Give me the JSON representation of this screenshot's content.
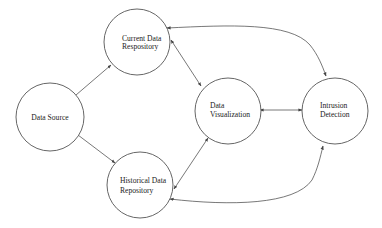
{
  "diagram": {
    "type": "flow",
    "nodes": [
      {
        "id": "data_source",
        "label_lines": [
          "Data Source"
        ],
        "cx": 50,
        "cy": 117,
        "r": 34
      },
      {
        "id": "current_repo",
        "label_lines": [
          "Current Data",
          "Respository"
        ],
        "cx": 137,
        "cy": 42,
        "r": 33
      },
      {
        "id": "historical_repo",
        "label_lines": [
          "Historical Data",
          "Repository"
        ],
        "cx": 140,
        "cy": 185,
        "r": 33
      },
      {
        "id": "visualization",
        "label_lines": [
          "Data",
          "Visualization"
        ],
        "cx": 228,
        "cy": 111,
        "r": 33
      },
      {
        "id": "intrusion_detection",
        "label_lines": [
          "Intrusion",
          "Detection"
        ],
        "cx": 335,
        "cy": 111,
        "r": 33
      }
    ],
    "edges": [
      {
        "from": "data_source",
        "to": "current_repo",
        "direction": "forward",
        "shape": "straight"
      },
      {
        "from": "data_source",
        "to": "historical_repo",
        "direction": "forward",
        "shape": "straight"
      },
      {
        "from": "current_repo",
        "to": "visualization",
        "direction": "both",
        "shape": "straight"
      },
      {
        "from": "historical_repo",
        "to": "visualization",
        "direction": "both",
        "shape": "straight"
      },
      {
        "from": "visualization",
        "to": "intrusion_detection",
        "direction": "both",
        "shape": "straight"
      },
      {
        "from": "current_repo",
        "to": "intrusion_detection",
        "direction": "both",
        "shape": "curved-top"
      },
      {
        "from": "historical_repo",
        "to": "intrusion_detection",
        "direction": "both",
        "shape": "curved-bottom"
      }
    ],
    "colors": {
      "stroke": "#555555",
      "text": "#222222",
      "background": "#ffffff"
    }
  }
}
